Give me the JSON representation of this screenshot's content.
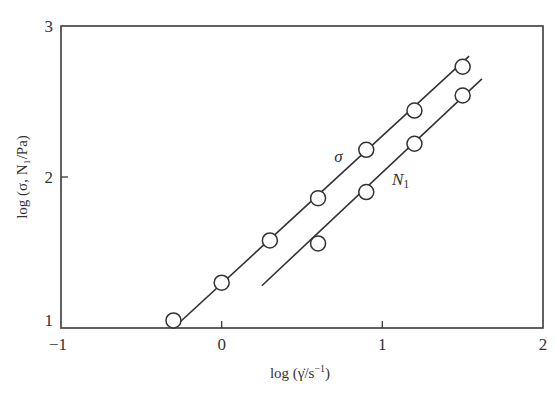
{
  "chart_data": {
    "type": "scatter",
    "title": "",
    "xlabel": "log (γ̇/s⁻¹)",
    "ylabel": "log (σ, N₁/Pa)",
    "xlim": [
      -1,
      2
    ],
    "ylim": [
      1,
      3
    ],
    "xticks": [
      -1,
      0,
      1,
      2
    ],
    "yticks": [
      1,
      2,
      3
    ],
    "grid": false,
    "legend": "inline labels",
    "series": [
      {
        "name": "σ",
        "marker": "open-circle",
        "points": [
          {
            "x": -0.3,
            "y": 1.05
          },
          {
            "x": 0.0,
            "y": 1.3
          },
          {
            "x": 0.3,
            "y": 1.58
          },
          {
            "x": 0.6,
            "y": 1.86
          },
          {
            "x": 0.9,
            "y": 2.18
          },
          {
            "x": 1.2,
            "y": 2.44
          },
          {
            "x": 1.5,
            "y": 2.73
          }
        ],
        "fit_line": {
          "x0": -0.3,
          "y0": 1.0,
          "x1": 1.54,
          "y1": 2.8
        },
        "label_pos": {
          "x": 0.7,
          "y": 2.1
        }
      },
      {
        "name": "N1",
        "marker": "open-circle",
        "points": [
          {
            "x": 0.6,
            "y": 1.56
          },
          {
            "x": 0.9,
            "y": 1.9
          },
          {
            "x": 1.2,
            "y": 2.22
          },
          {
            "x": 1.5,
            "y": 2.54
          }
        ],
        "fit_line": {
          "x0": 0.25,
          "y0": 1.28,
          "x1": 1.62,
          "y1": 2.65
        },
        "label_pos": {
          "x": 1.06,
          "y": 1.95
        }
      }
    ]
  },
  "labels": {
    "x_ticks": [
      "−1",
      "0",
      "1",
      "2"
    ],
    "y_ticks": [
      "1",
      "2",
      "3"
    ],
    "xlabel_prefix": "log",
    "xlabel_var": "γ̇/s",
    "xlabel_sup": "−1",
    "ylabel": "log (σ, N₁/Pa)",
    "sigma_label": "σ",
    "n1_label_main": "N",
    "n1_label_sub": "1"
  }
}
